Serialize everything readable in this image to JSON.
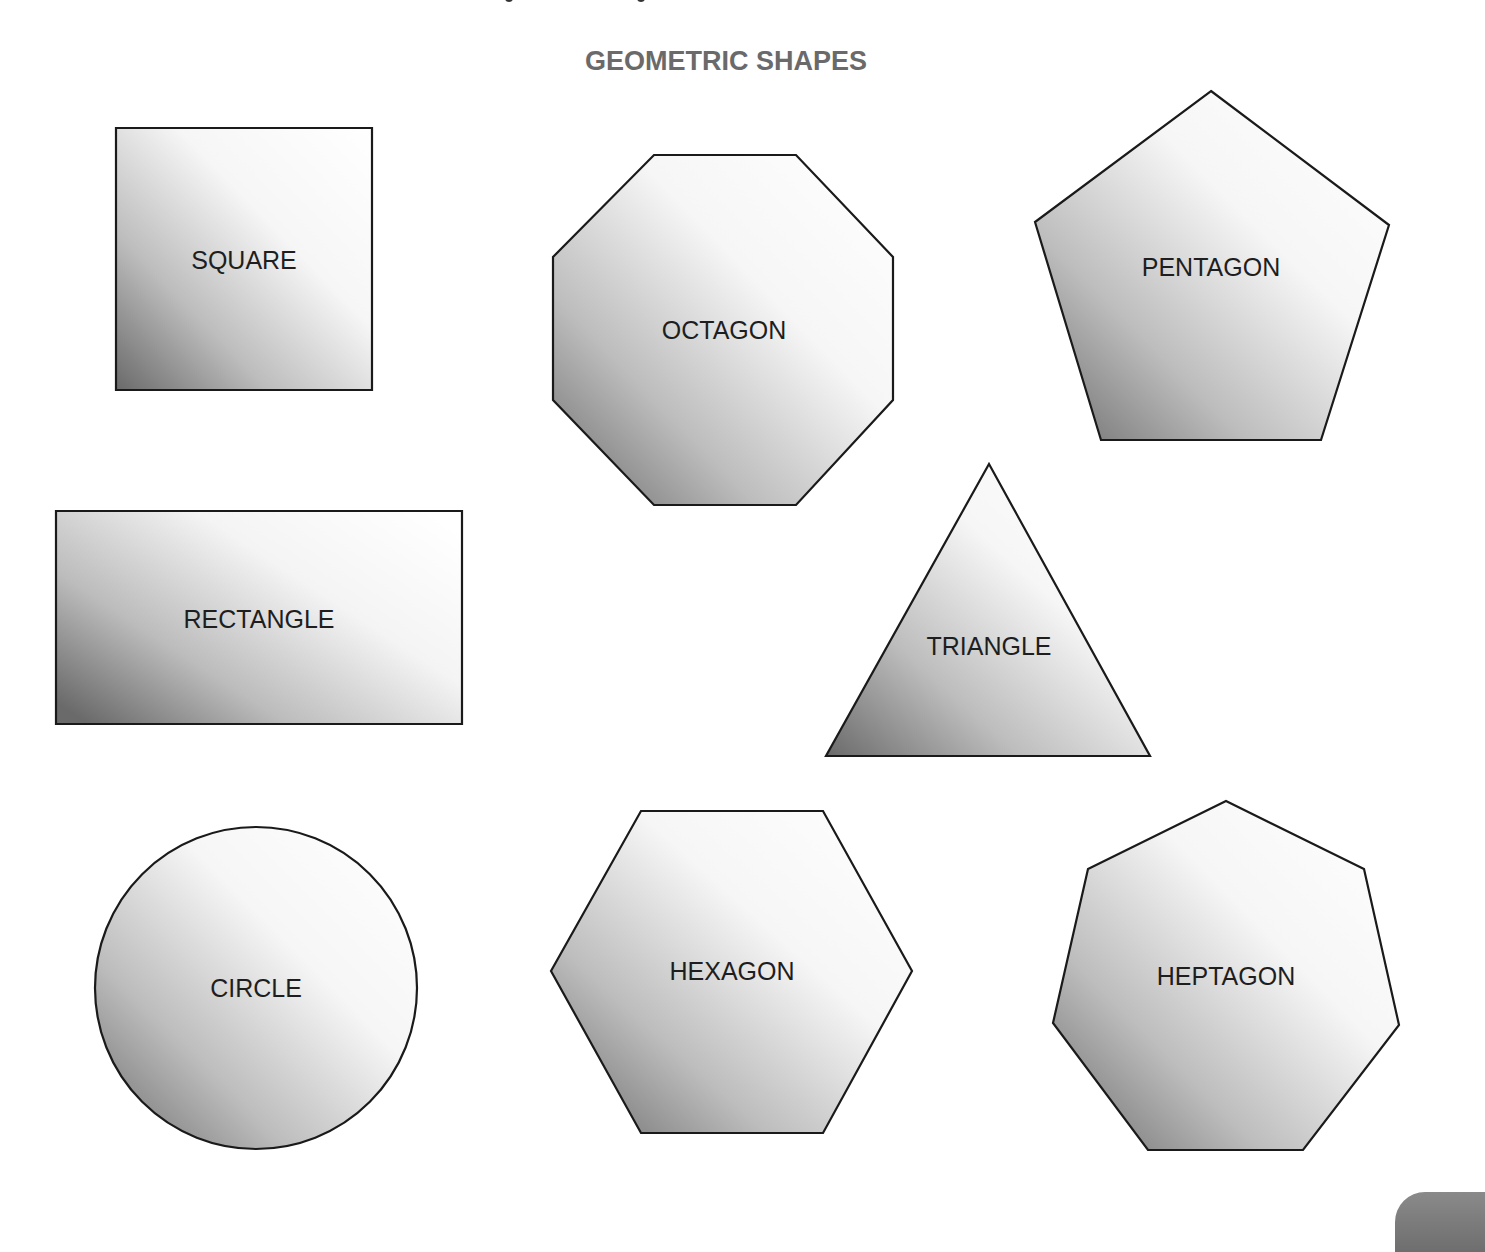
{
  "page": {
    "title": "GEOMETRIC SHAPES",
    "title_color": "#6a6a6a",
    "background": "#ffffff"
  },
  "style": {
    "gradient_light": "#ffffff",
    "gradient_dark": "#6a6a6a",
    "stroke_color": "#1a1a1a",
    "label_color": "#1e1e1e"
  },
  "shapes": [
    {
      "id": "square",
      "label": "SQUARE",
      "type": "polygon",
      "points": "116,128 372,128 372,390 116,390",
      "label_x": 244,
      "label_y": 269
    },
    {
      "id": "octagon",
      "label": "OCTAGON",
      "type": "polygon",
      "points": "654,155 796,155 893,257 893,400 796,505 654,505 553,400 553,257",
      "label_x": 724,
      "label_y": 339
    },
    {
      "id": "pentagon",
      "label": "PENTAGON",
      "type": "polygon",
      "points": "1211,91 1389,225 1321,440 1101,440 1035,222",
      "label_x": 1211,
      "label_y": 276
    },
    {
      "id": "rectangle",
      "label": "RECTANGLE",
      "type": "polygon",
      "points": "56,511 462,511 462,724 56,724",
      "label_x": 259,
      "label_y": 628
    },
    {
      "id": "triangle",
      "label": "TRIANGLE",
      "type": "polygon",
      "points": "989,464 1150,756 826,756",
      "label_x": 989,
      "label_y": 655
    },
    {
      "id": "circle",
      "label": "CIRCLE",
      "type": "circle",
      "cx": 256,
      "cy": 988,
      "r": 161,
      "label_x": 256,
      "label_y": 997
    },
    {
      "id": "hexagon",
      "label": "HEXAGON",
      "type": "polygon",
      "points": "641,811 823,811 912,971 823,1133 641,1133 551,971",
      "label_x": 732,
      "label_y": 980
    },
    {
      "id": "heptagon",
      "label": "HEPTAGON",
      "type": "polygon",
      "points": "1226,801 1364,869 1399,1025 1303,1150 1148,1150 1053,1023 1088,869",
      "label_x": 1226,
      "label_y": 985
    }
  ]
}
